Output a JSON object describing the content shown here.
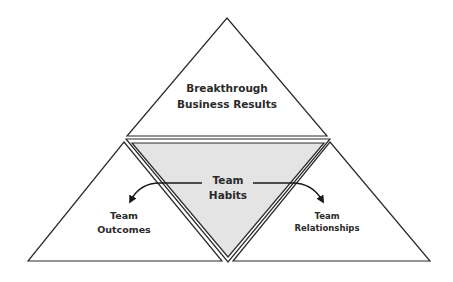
{
  "diagram": {
    "top": {
      "line1": "Breakthrough",
      "line2": "Business Results"
    },
    "center": {
      "line1": "Team",
      "line2": "Habits"
    },
    "left": {
      "line1": "Team",
      "line2": "Outcomes"
    },
    "right": {
      "line1": "Team",
      "line2": "Relationships"
    }
  },
  "colors": {
    "stroke": "#2b2b2b",
    "center_fill": "#e4e4e4",
    "background": "#ffffff"
  }
}
